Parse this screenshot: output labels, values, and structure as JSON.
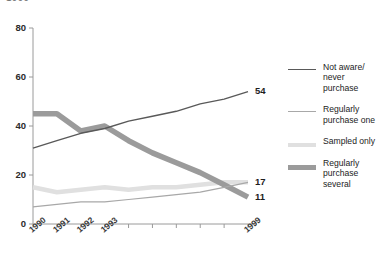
{
  "clipped_title": "1999",
  "chart_data": {
    "type": "line",
    "title": "",
    "xlabel": "",
    "ylabel": "",
    "x": [
      "1990",
      "1991",
      "1992",
      "1993",
      "1994",
      "1995",
      "1996",
      "1997",
      "1998",
      "1999"
    ],
    "xtick_labels_shown": [
      "1990",
      "1991",
      "1992",
      "1993",
      "1999"
    ],
    "ylim": [
      0,
      80
    ],
    "yticks": [
      0,
      20,
      40,
      60,
      80
    ],
    "grid": false,
    "legend_position": "right",
    "series": [
      {
        "name": "Not aware/\nnever\npurchase",
        "color": "#595959",
        "width": 1.4,
        "end_label": "54",
        "values": [
          31,
          34,
          37,
          39,
          42,
          44,
          46,
          49,
          51,
          54
        ]
      },
      {
        "name": "Regularly\npurchase one",
        "color": "#a8a8a8",
        "width": 1.2,
        "end_label": "",
        "values": [
          7,
          8,
          9,
          9,
          10,
          11,
          12,
          13,
          15,
          17
        ]
      },
      {
        "name": "Sampled only",
        "color": "#e0e0e0",
        "width": 4.5,
        "end_label": "17",
        "values": [
          15,
          13,
          14,
          15,
          14,
          15,
          15,
          16,
          17,
          17
        ]
      },
      {
        "name": "Regularly\npurchase\nseveral",
        "color": "#9b9b9b",
        "width": 5.5,
        "end_label": "11",
        "values": [
          45,
          45,
          38,
          40,
          34,
          29,
          25,
          21,
          16,
          11
        ]
      }
    ]
  }
}
